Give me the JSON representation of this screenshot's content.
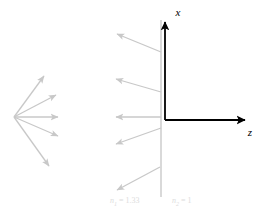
{
  "figure": {
    "title": "",
    "background_color": "#ffffff",
    "axis_color": "#000000",
    "ray_color": "#c8c8c8",
    "interface_color": "#d9d9d9",
    "label_color": "#dcdcdc",
    "axes": {
      "vertical": {
        "label": "x",
        "label_x": 178,
        "label_y": 16,
        "x": 165,
        "y_start": 120,
        "y_end": 22
      },
      "horizontal": {
        "label": "z",
        "label_x": 250,
        "label_y": 136,
        "y": 120,
        "x_start": 165,
        "x_end": 245
      },
      "origin": {
        "x": 165,
        "y": 120
      }
    },
    "interface": {
      "name": "refractive-boundary",
      "x": 161,
      "y_top": 20,
      "y_bottom": 197
    },
    "media": [
      {
        "name": "medium-left",
        "label": "n",
        "subscript": "1",
        "equals": " = ",
        "value": "1.33",
        "x": 110,
        "y": 203
      },
      {
        "name": "medium-right",
        "label": "n",
        "subscript": "2",
        "equals": " = ",
        "value": "1",
        "x": 172,
        "y": 203
      }
    ],
    "source_fan": {
      "name": "incident-ray-fan",
      "origin": {
        "x": 14,
        "y": 117
      },
      "rays": [
        {
          "name": "incident-ray-1",
          "x2": 44,
          "y2": 76
        },
        {
          "name": "incident-ray-2",
          "x2": 56,
          "y2": 95
        },
        {
          "name": "incident-ray-3",
          "x2": 58,
          "y2": 117
        },
        {
          "name": "incident-ray-4",
          "x2": 58,
          "y2": 136
        },
        {
          "name": "incident-ray-5",
          "x2": 49,
          "y2": 166
        }
      ]
    },
    "refracted_rays": {
      "name": "refracted-ray-bundle",
      "rays": [
        {
          "name": "refracted-ray-1",
          "x1": 161,
          "y1": 52,
          "x2": 117,
          "y2": 34
        },
        {
          "name": "refracted-ray-2",
          "x1": 161,
          "y1": 92,
          "x2": 116,
          "y2": 79
        },
        {
          "name": "refracted-ray-3",
          "x1": 161,
          "y1": 117,
          "x2": 116,
          "y2": 117
        },
        {
          "name": "refracted-ray-4",
          "x1": 161,
          "y1": 128,
          "x2": 116,
          "y2": 144
        },
        {
          "name": "refracted-ray-5",
          "x1": 160,
          "y1": 167,
          "x2": 117,
          "y2": 190
        }
      ]
    }
  }
}
